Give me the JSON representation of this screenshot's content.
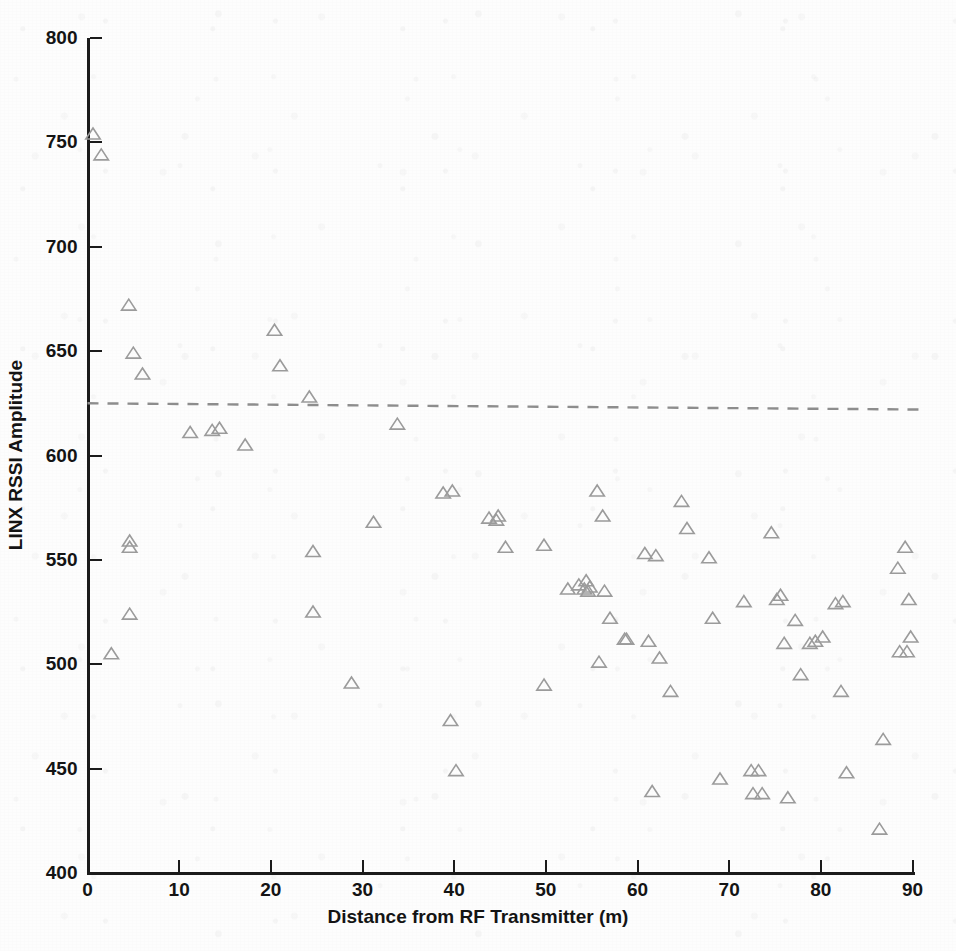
{
  "figure": {
    "marker_symbol": "triangle-up-outline",
    "marker_color": "#9b9b9b",
    "axis_color": "#1b1b1b",
    "threshold_color": "#8d8d8d",
    "background_color": "#fdfdfd"
  },
  "chart_data": {
    "type": "scatter",
    "title": "",
    "xlabel": "Distance from RF Transmitter (m)",
    "ylabel": "LINX RSSI Amplitude",
    "xlim": [
      0,
      90
    ],
    "ylim": [
      400,
      800
    ],
    "xticks": [
      0,
      10,
      20,
      30,
      40,
      50,
      60,
      70,
      80,
      90
    ],
    "xtick_labels": [
      "0",
      "10",
      "20",
      "30",
      "40",
      "50",
      "60",
      "70",
      "80",
      "90"
    ],
    "yticks": [
      400,
      450,
      500,
      550,
      600,
      650,
      700,
      750,
      800
    ],
    "ytick_labels": [
      "400",
      "450",
      "500",
      "550",
      "600",
      "650",
      "700",
      "750",
      "800"
    ],
    "grid": false,
    "legend": null,
    "series": [
      {
        "name": "LINX RSSI samples",
        "marker": "triangle-up-outline",
        "color": "#9b9b9b",
        "points": [
          [
            0.6,
            754
          ],
          [
            1.5,
            744
          ],
          [
            4.5,
            672
          ],
          [
            5.0,
            649
          ],
          [
            6.0,
            639
          ],
          [
            4.6,
            559
          ],
          [
            4.6,
            556
          ],
          [
            4.6,
            524
          ],
          [
            2.6,
            505
          ],
          [
            11.2,
            611
          ],
          [
            13.6,
            612
          ],
          [
            14.4,
            613
          ],
          [
            17.2,
            605
          ],
          [
            20.4,
            660
          ],
          [
            21.0,
            643
          ],
          [
            24.2,
            628
          ],
          [
            24.6,
            554
          ],
          [
            24.6,
            525
          ],
          [
            28.8,
            491
          ],
          [
            31.2,
            568
          ],
          [
            33.8,
            615
          ],
          [
            38.8,
            582
          ],
          [
            39.8,
            583
          ],
          [
            39.6,
            473
          ],
          [
            40.2,
            449
          ],
          [
            43.8,
            570
          ],
          [
            44.6,
            569
          ],
          [
            44.8,
            571
          ],
          [
            45.6,
            556
          ],
          [
            49.8,
            557
          ],
          [
            49.8,
            490
          ],
          [
            53.6,
            538
          ],
          [
            54.2,
            536
          ],
          [
            54.4,
            540
          ],
          [
            54.6,
            535
          ],
          [
            54.8,
            537
          ],
          [
            52.4,
            536
          ],
          [
            55.6,
            583
          ],
          [
            56.2,
            571
          ],
          [
            56.4,
            535
          ],
          [
            55.8,
            501
          ],
          [
            57.0,
            522
          ],
          [
            58.6,
            512
          ],
          [
            58.8,
            512
          ],
          [
            60.8,
            553
          ],
          [
            61.2,
            511
          ],
          [
            61.6,
            439
          ],
          [
            62.0,
            552
          ],
          [
            62.4,
            503
          ],
          [
            63.6,
            487
          ],
          [
            64.8,
            578
          ],
          [
            65.4,
            565
          ],
          [
            67.8,
            551
          ],
          [
            68.2,
            522
          ],
          [
            69.0,
            445
          ],
          [
            71.6,
            530
          ],
          [
            72.4,
            449
          ],
          [
            73.2,
            449
          ],
          [
            72.6,
            438
          ],
          [
            73.6,
            438
          ],
          [
            74.6,
            563
          ],
          [
            75.2,
            531
          ],
          [
            75.6,
            533
          ],
          [
            76.0,
            510
          ],
          [
            76.4,
            436
          ],
          [
            77.2,
            521
          ],
          [
            77.8,
            495
          ],
          [
            78.8,
            510
          ],
          [
            79.4,
            511
          ],
          [
            80.2,
            513
          ],
          [
            81.6,
            529
          ],
          [
            82.4,
            530
          ],
          [
            82.2,
            487
          ],
          [
            82.8,
            448
          ],
          [
            86.4,
            421
          ],
          [
            86.8,
            464
          ],
          [
            88.4,
            546
          ],
          [
            89.2,
            556
          ],
          [
            89.6,
            531
          ],
          [
            88.6,
            506
          ],
          [
            89.4,
            506
          ],
          [
            89.8,
            513
          ]
        ]
      }
    ],
    "annotations": [
      {
        "type": "threshold-line",
        "style": "dashed",
        "label": "",
        "y_start": 625,
        "y_end": 622,
        "x_start": 0,
        "x_end": 91.5
      }
    ]
  }
}
